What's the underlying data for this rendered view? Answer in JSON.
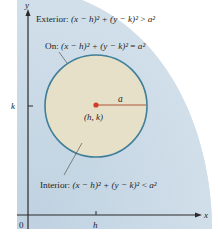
{
  "figure": {
    "type": "circle-regions",
    "colors": {
      "exterior_fill": "#c9d9e6",
      "interior_fill": "#e6e0c8",
      "circle_stroke": "#3f7f99",
      "center_dot": "#d43a2a",
      "radius_line": "#b0573a",
      "axis": "#2a2a2a",
      "leader_line": "#555555"
    },
    "axes": {
      "x_label": "x",
      "y_label": "y",
      "origin_label": "0",
      "x_tick_label": "h",
      "y_tick_label": "k"
    },
    "circle": {
      "center_label": "(h, k)",
      "radius_label": "a"
    },
    "regions": {
      "exterior": {
        "prefix": "Exterior: ",
        "lhs": "(x − h)² + (y − k)²",
        "relation": " > ",
        "rhs": "a²"
      },
      "on": {
        "prefix": "On: ",
        "lhs": "(x − h)² + (y − k)²",
        "relation": " = ",
        "rhs": "a²"
      },
      "interior": {
        "prefix": "Interior: ",
        "lhs": "(x − h)² + (y − k)²",
        "relation": " < ",
        "rhs": "a²"
      }
    }
  }
}
